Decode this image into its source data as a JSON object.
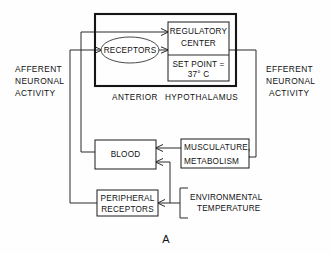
{
  "figure": {
    "panel_label": "A",
    "nodes": {
      "hypothalamus_box_label_left": "ANTERIOR",
      "hypothalamus_box_label_right": "HYPOTHALAMUS",
      "receptors": "RECEPTORS",
      "regulatory_center_line1": "REGULATORY",
      "regulatory_center_line2": "CENTER",
      "set_point_line1": "SET POINT =",
      "set_point_line2": "37° C",
      "blood": "BLOOD",
      "musculature_line1": "MUSCULATURE,",
      "musculature_line2": "METABOLISM",
      "peripheral_line1": "PERIPHERAL",
      "peripheral_line2": "RECEPTORS",
      "environmental_line1": "ENVIRONMENTAL",
      "environmental_line2": "TEMPERATURE"
    },
    "side_labels": {
      "afferent_line1": "AFFERENT",
      "afferent_line2": "NEURONAL",
      "afferent_line3": "ACTIVITY",
      "efferent_line1": "EFFERENT",
      "efferent_line2": "NEURONAL",
      "efferent_line3": "ACTIVITY"
    },
    "colors": {
      "background": "#ffffff",
      "line": "#2b2b2b",
      "thick_line": "#151515",
      "ellipse_line": "#4a4a4a",
      "text": "#111111"
    }
  }
}
